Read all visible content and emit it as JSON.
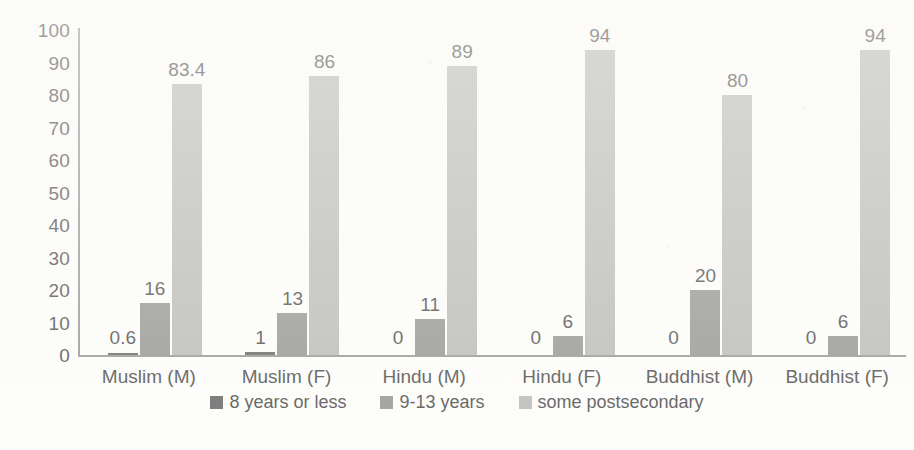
{
  "chart_data": {
    "type": "bar",
    "title": "",
    "subtitle": "",
    "xlabel": "",
    "ylabel": "",
    "ylim": [
      0,
      100
    ],
    "ytick_step": 10,
    "yticks": [
      100,
      90,
      80,
      70,
      60,
      50,
      40,
      30,
      20,
      10,
      0
    ],
    "grid": false,
    "legend_position": "bottom",
    "categories": [
      "Muslim (M)",
      "Muslim (F)",
      "Hindu (M)",
      "Hindu (F)",
      "Buddhist (M)",
      "Buddhist (F)"
    ],
    "series": [
      {
        "name": "8 years or less",
        "color": "#585858",
        "values": [
          0.6,
          1,
          0,
          0,
          0,
          0
        ],
        "labels": [
          "0.6",
          "1",
          "0",
          "0",
          "0",
          "0"
        ]
      },
      {
        "name": "9-13 years",
        "color": "#8b8b8b",
        "values": [
          16,
          13,
          11,
          6,
          20,
          6
        ],
        "labels": [
          "16",
          "13",
          "11",
          "6",
          "20",
          "6"
        ]
      },
      {
        "name": "some postsecondary",
        "color": "#b4b4b4",
        "values": [
          83.4,
          86,
          89,
          94,
          80,
          94
        ],
        "labels": [
          "83.4",
          "86",
          "89",
          "94",
          "80",
          "94"
        ]
      }
    ]
  },
  "legend": {
    "items": [
      {
        "label": "8 years or less",
        "color": "#585858"
      },
      {
        "label": "9-13 years",
        "color": "#8b8b8b"
      },
      {
        "label": "some postsecondary",
        "color": "#b4b4b4"
      }
    ]
  }
}
